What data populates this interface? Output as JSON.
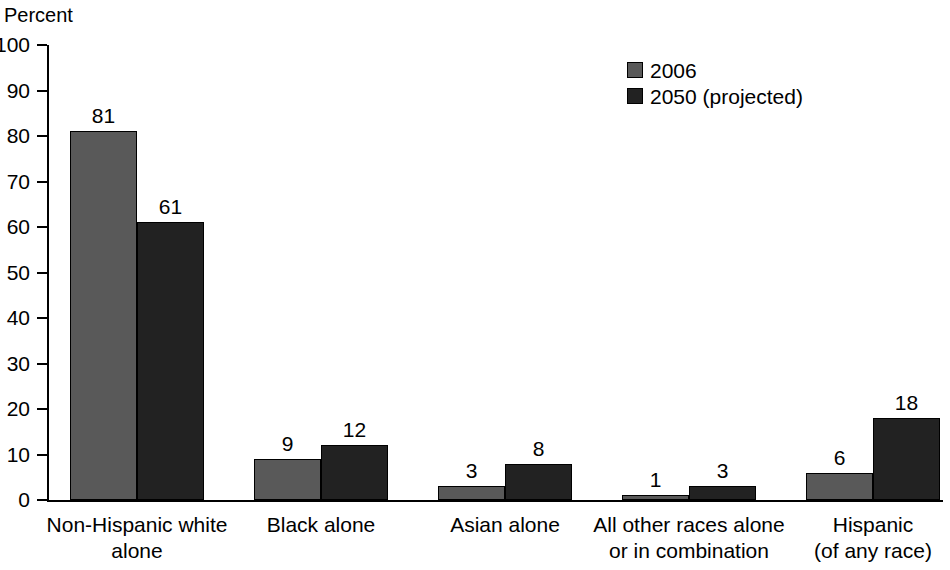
{
  "chart_data": {
    "type": "bar",
    "title": "",
    "xlabel": "",
    "ylabel": "Percent",
    "ylim": [
      0,
      100
    ],
    "ytick_step": 10,
    "yticks": [
      100,
      90,
      80,
      70,
      60,
      50,
      40,
      30,
      20,
      10,
      0
    ],
    "grid": false,
    "legend_position": "top-right",
    "categories": [
      "Non-Hispanic white alone",
      "Black alone",
      "Asian alone",
      "All other races alone or in combination",
      "Hispanic (of any race)"
    ],
    "category_label_lines": [
      [
        "Non-Hispanic white",
        "alone"
      ],
      [
        "Black alone"
      ],
      [
        "Asian alone"
      ],
      [
        "All other races alone",
        "or in combination"
      ],
      [
        "Hispanic",
        "(of any race)"
      ]
    ],
    "series": [
      {
        "name": "2006",
        "color": "#595959",
        "values": [
          81,
          9,
          3,
          1,
          6
        ]
      },
      {
        "name": "2050 (projected)",
        "color": "#222222",
        "values": [
          61,
          12,
          8,
          3,
          18
        ]
      }
    ]
  },
  "legend": {
    "items": [
      {
        "label": "2006",
        "color": "#595959"
      },
      {
        "label": "2050 (projected)",
        "color": "#222222"
      }
    ]
  },
  "axis": {
    "y_title": "Percent"
  }
}
